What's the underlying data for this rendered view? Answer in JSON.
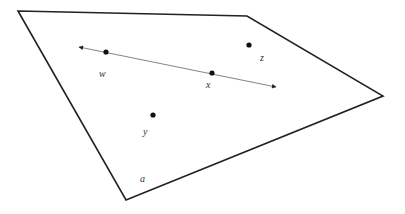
{
  "diagram": {
    "type": "geometry-plane-with-line",
    "plane": {
      "label": "a",
      "vertices": [
        [
          18,
          11
        ],
        [
          247,
          16
        ],
        [
          383,
          96
        ],
        [
          126,
          200
        ]
      ],
      "stroke": "#222222",
      "label_pos": [
        140,
        182
      ]
    },
    "line": {
      "from": [
        79,
        47
      ],
      "to": [
        276,
        87
      ],
      "stroke": "#777777",
      "arrows": "both"
    },
    "points": [
      {
        "name": "w",
        "pos": [
          106,
          52
        ],
        "label_pos": [
          99,
          77
        ]
      },
      {
        "name": "x",
        "pos": [
          212,
          73
        ],
        "label_pos": [
          206,
          88
        ]
      },
      {
        "name": "z",
        "pos": [
          249,
          45
        ],
        "label_pos": [
          260,
          61
        ]
      },
      {
        "name": "y",
        "pos": [
          153,
          115
        ],
        "label_pos": [
          143,
          135
        ]
      }
    ]
  }
}
